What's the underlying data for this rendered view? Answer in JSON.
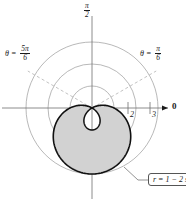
{
  "chart_data": {
    "type": "line",
    "subtype": "polar",
    "title": "",
    "equation_label": "r = 1 − 2 sin θ",
    "polar_function": "r = 1 - 2*sin(theta)",
    "curve_name": "limacon with inner loop",
    "r_max_outer": 3,
    "r_max_inner_loop": 1,
    "grid": {
      "circles_r": [
        1,
        2,
        3
      ],
      "show_circles": true,
      "rays_dashed_theta": [
        "π/6",
        "5π/6"
      ]
    },
    "axes": {
      "radial_ticks": [
        {
          "value": 2,
          "label": "2"
        },
        {
          "value": 3,
          "label": "3"
        }
      ],
      "angle_labels": [
        {
          "label_num": "π",
          "label_den": "2",
          "theta_deg": 90,
          "position": "top"
        },
        {
          "label": "0",
          "theta_deg": 0,
          "position": "right"
        }
      ]
    },
    "annotations": [
      {
        "text": "θ =",
        "num": "5π",
        "den": "6",
        "position": "upper-left"
      },
      {
        "text": "θ =",
        "num": "π",
        "den": "6",
        "position": "upper-right"
      }
    ],
    "shading": {
      "description": "region between inner loop and outer loop",
      "fill_color": "#d2d2d2"
    },
    "colors": {
      "curve": "#111111",
      "grid": "#9a9a9a",
      "axis": "#6e6e6e",
      "dashed_ray": "#b0b0b0",
      "shade": "#d2d2d2",
      "callout_border": "#555555",
      "background": "#ffffff"
    }
  },
  "labels": {
    "tick_2": "2",
    "tick_3": "3",
    "axis_zero": "0",
    "pi_num": "π",
    "pi_den": "2",
    "theta_eq": "θ =",
    "left_num": "5π",
    "left_den": "6",
    "right_num": "π",
    "right_den": "6",
    "callout": "r = 1 − 2 sin θ"
  }
}
